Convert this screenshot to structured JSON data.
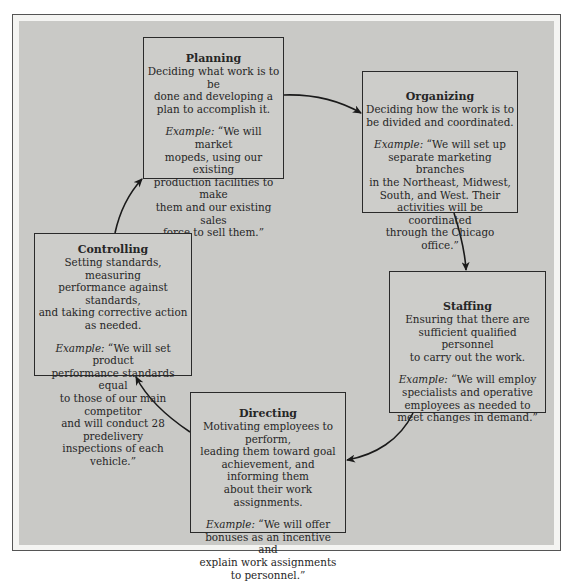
{
  "diagram": {
    "type": "cycle",
    "direction": "clockwise",
    "colors": {
      "frame_outer": "#f4f4f2",
      "frame_inner": "#c9c9c6",
      "box_fill": "#cdcdca",
      "border": "#2a2a2a",
      "text": "#262626"
    },
    "nodes": [
      {
        "id": "planning",
        "title": "Planning",
        "description": "Deciding what work is to be\ndone and developing a\nplan to accomplish it.",
        "example_label": "Example:",
        "example_text": " “We will market\nmopeds, using our existing\nproduction facilities to make\nthem and our existing sales\nforce to sell them.”"
      },
      {
        "id": "organizing",
        "title": "Organizing",
        "description": "Deciding how the work is to\nbe divided and coordinated.",
        "example_label": "Example:",
        "example_text": " “We will set up\nseparate marketing branches\nin the Northeast, Midwest,\nSouth, and West. Their\nactivities will be coordinated\nthrough the Chicago office.”"
      },
      {
        "id": "staffing",
        "title": "Staffing",
        "description": "Ensuring that there are\nsufficient qualified personnel\nto carry out the work.",
        "example_label": "Example:",
        "example_text": " “We will employ\nspecialists and operative\nemployees as needed to\nmeet changes in demand.”"
      },
      {
        "id": "directing",
        "title": "Directing",
        "description": "Motivating employees to perform,\nleading them toward goal\nachievement, and informing them\nabout their work assignments.",
        "example_label": "Example:",
        "example_text": " “We will offer\nbonuses as an incentive and\nexplain work assignments\nto personnel.”"
      },
      {
        "id": "controlling",
        "title": "Controlling",
        "description": "Setting standards, measuring\nperformance against standards,\nand taking corrective action\nas needed.",
        "example_label": "Example:",
        "example_text": " “We will set product\nperformance standards equal\nto those of our main competitor\nand will conduct 28 predelivery\ninspections of each vehicle.”"
      }
    ],
    "edges": [
      {
        "from": "planning",
        "to": "organizing"
      },
      {
        "from": "organizing",
        "to": "staffing"
      },
      {
        "from": "staffing",
        "to": "directing"
      },
      {
        "from": "directing",
        "to": "controlling"
      },
      {
        "from": "controlling",
        "to": "planning"
      }
    ]
  }
}
